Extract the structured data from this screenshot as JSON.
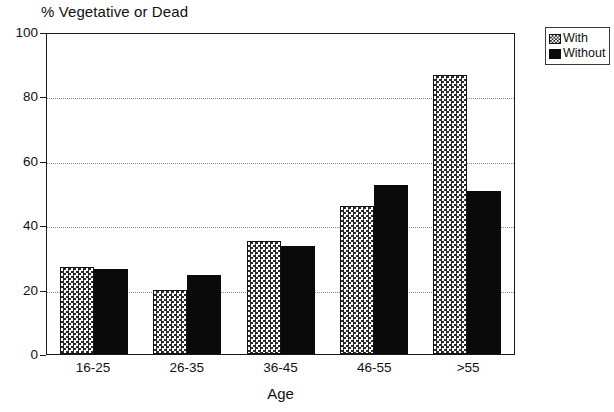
{
  "chart_data": {
    "type": "bar",
    "title": "",
    "ylabel": "% Vegetative or Dead",
    "xlabel": "Age",
    "categories": [
      "16-25",
      "26-35",
      "36-45",
      "46-55",
      ">55"
    ],
    "series": [
      {
        "name": "With",
        "values": [
          27,
          20,
          35,
          46,
          86.5
        ]
      },
      {
        "name": "Without",
        "values": [
          26.5,
          24.5,
          33.5,
          52.5,
          50.5
        ]
      }
    ],
    "ylim": [
      0,
      100
    ],
    "ytick_labels": [
      "0",
      "20",
      "40",
      "60",
      "80",
      "100"
    ],
    "ytick_values": [
      0,
      20,
      40,
      60,
      80,
      100
    ],
    "gridlines": [
      20,
      40,
      60,
      80
    ],
    "grid": true,
    "legend_position": "top-right-outside",
    "colors": {
      "with_fill": "#ffffff",
      "with_hatch": "#2b2b2b",
      "without_fill": "#0a0a0a",
      "axis": "#1a1a1a",
      "gridline": "#8d8d8d",
      "background": "#ffffff"
    }
  },
  "legend": {
    "entries": [
      {
        "label": "With",
        "swatch": "checkerboard-hatch-swatch"
      },
      {
        "label": "Without",
        "swatch": "solid-black-swatch"
      }
    ]
  }
}
